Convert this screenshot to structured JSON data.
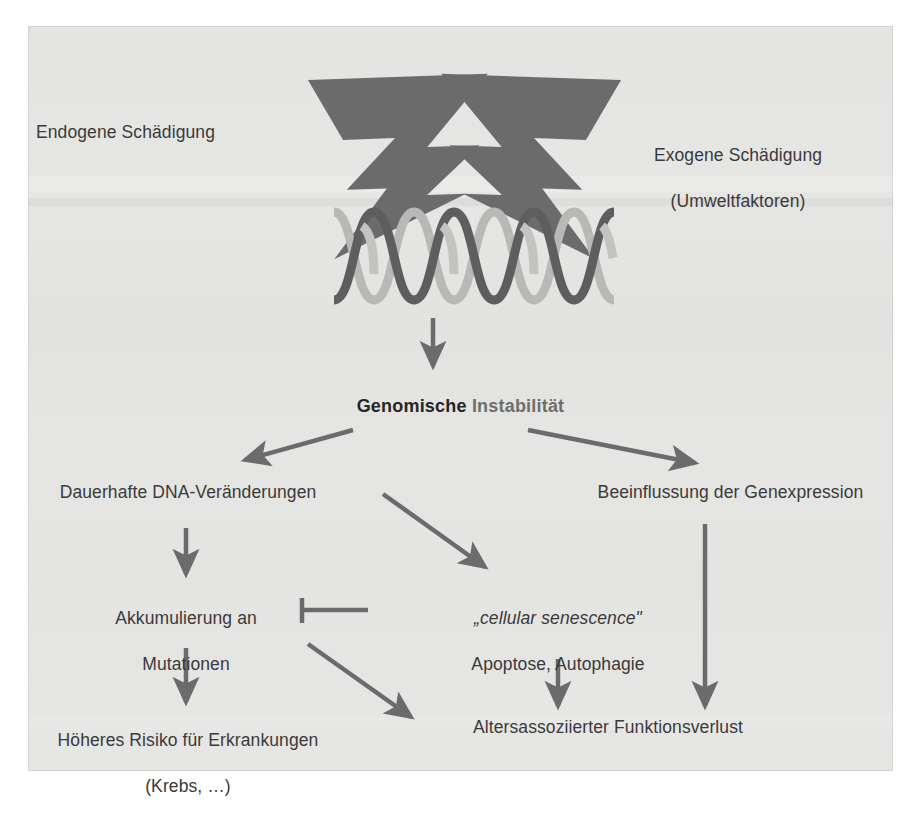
{
  "figure": {
    "background_color": "#e4e4e2",
    "text_color": "#3a3a3a",
    "accent_dark": "#595959",
    "accent_light": "#b0b0ae"
  },
  "nodes": {
    "endogene": "Endogene Schädigung",
    "exogene_line1": "Exogene Schädigung",
    "exogene_line2": "(Umweltfaktoren)",
    "title_bold": "Genomische",
    "title_light": "Instabilität",
    "dauerhafte": "Dauerhafte DNA-Veränderungen",
    "beeinflussung": "Beeinflussung der Genexpression",
    "akkumulierung_line1": "Akkumulierung an",
    "akkumulierung_line2": "Mutationen",
    "senescence_line1": "„cellular senescence\"",
    "senescence_line2": "Apoptose, Autophagie",
    "risiko_line1": "Höheres Risiko für Erkrankungen",
    "risiko_line2": "(Krebs, …)",
    "funktionsverlust": "Altersassoziierter Funktionsverlust"
  },
  "graphics": {
    "lightning_left": "lightning-bolt-icon",
    "lightning_right": "lightning-bolt-icon",
    "dna": "dna-double-helix-icon",
    "arrow_dna_down": "arrow-down-icon",
    "arrow_split_left": "arrow-diagonal-left-icon",
    "arrow_split_right": "arrow-diagonal-right-icon",
    "arrow_dauerhafte_down": "arrow-down-icon",
    "arrow_to_senescence": "arrow-diagonal-right-icon",
    "arrow_akkumulierung_down": "arrow-down-icon",
    "arrow_akkumulierung_to_funktionsverlust": "arrow-diagonal-right-icon",
    "arrow_senescence_down": "arrow-down-icon",
    "arrow_genexpression_down": "arrow-down-icon",
    "inhibition_bar": "inhibition-tbar-icon"
  }
}
